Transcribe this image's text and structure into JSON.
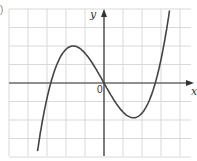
{
  "figure": {
    "part_label": ")",
    "x_axis_label": "x",
    "y_axis_label": "y",
    "origin_label": "0"
  },
  "chart_data": {
    "type": "line",
    "title": "",
    "xlabel": "x",
    "ylabel": "y",
    "grid": true,
    "xlim": [
      -5,
      4.5
    ],
    "ylim": [
      -3.8,
      4
    ],
    "series": [
      {
        "name": "cubic curve",
        "x": [
          -3.5,
          -3.0,
          -2.8,
          -2.5,
          -2.0,
          -1.6,
          -1.2,
          -0.8,
          -0.4,
          0.0,
          0.4,
          0.8,
          1.2,
          1.5,
          1.8,
          2.2,
          2.7,
          3.0,
          3.5,
          3.5
        ],
        "y": [
          -3.8,
          -1.1,
          0.0,
          1.1,
          1.85,
          2.0,
          1.75,
          1.2,
          0.6,
          0.0,
          -0.6,
          -1.2,
          -1.7,
          -1.85,
          -1.7,
          -1.1,
          0.0,
          1.2,
          3.2,
          4.0
        ]
      }
    ],
    "key_points": {
      "x_intercepts": [
        -2.8,
        0,
        2.7
      ],
      "local_max": [
        -1.6,
        2.0
      ],
      "local_min": [
        1.5,
        -1.85
      ]
    },
    "colors": {
      "curve": "#444444",
      "grid": "#d9d9d9",
      "axes": "#333333"
    }
  }
}
